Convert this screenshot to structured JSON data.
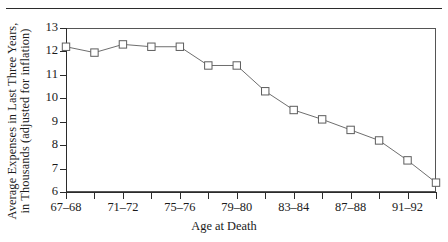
{
  "figure": {
    "top_rule": true,
    "axis_color": "#2b2b2b",
    "line_color": "#6e6e6e",
    "marker_fill": "#ffffff",
    "marker_stroke": "#5d5d5d"
  },
  "chart_data": {
    "type": "line",
    "title": "",
    "xlabel": "Age at Death",
    "ylabel": "Average Expenses in Last Three Years, in Thousands (adjusted for inflation)",
    "ylabel_lines": [
      "Average Expenses in Last Three Years,",
      "in Thousands (adjusted for inflation)"
    ],
    "categories": [
      "67-68",
      "69-70",
      "71-72",
      "73-74",
      "75-76",
      "77-78",
      "79-80",
      "81-82",
      "83-84",
      "85-86",
      "87-88",
      "89-90",
      "91-92",
      "93-94"
    ],
    "x_tick_labels": [
      "67–68",
      "71–72",
      "75–76",
      "79–80",
      "83–84",
      "87–88",
      "91–92"
    ],
    "values": [
      12.2,
      11.95,
      12.3,
      12.2,
      12.2,
      11.4,
      11.4,
      10.3,
      9.5,
      9.1,
      8.65,
      8.2,
      7.35,
      6.4
    ],
    "y_tick_labels": [
      "13",
      "12",
      "11",
      "10",
      "9",
      "8",
      "7",
      "6"
    ],
    "y_ticks": [
      13,
      12,
      11,
      10,
      9,
      8,
      7,
      6
    ],
    "ylim": [
      6,
      13
    ],
    "grid": false,
    "legend": "none",
    "marker": "square"
  }
}
